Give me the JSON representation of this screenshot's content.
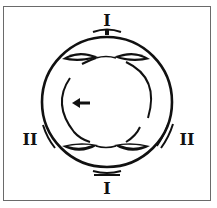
{
  "diagram": {
    "type": "schematic",
    "labels": {
      "top": "I",
      "bottom": "I",
      "left": "II",
      "right": "II"
    },
    "arrow": {
      "direction": "left"
    },
    "colors": {
      "stroke": "#111111",
      "frame": "#6a6a6a",
      "background": "#ffffff"
    }
  }
}
